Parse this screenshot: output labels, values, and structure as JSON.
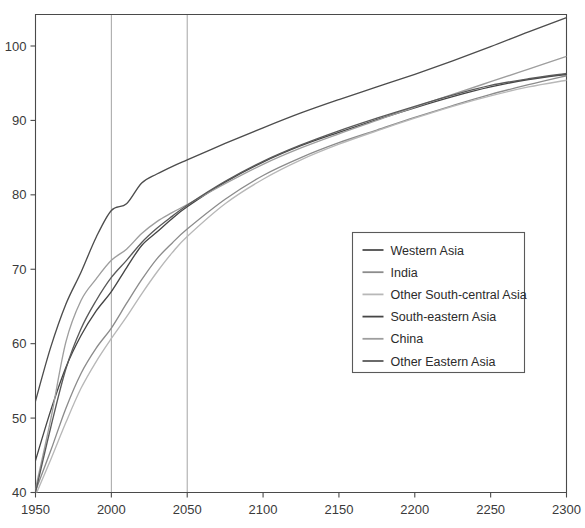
{
  "chart_data": {
    "type": "line",
    "title": "",
    "xlabel": "",
    "ylabel": "",
    "xlim": [
      1950,
      2300
    ],
    "ylim": [
      40,
      105
    ],
    "xticks": [
      1950,
      2000,
      2050,
      2100,
      2150,
      2200,
      2250,
      2300
    ],
    "yticks": [
      40,
      50,
      60,
      70,
      80,
      90,
      100
    ],
    "grid": "vertical gridlines at 2000 and 2050 only",
    "gridlines_x": [
      2000,
      2050
    ],
    "legend_position": "center-right inside axes",
    "x": [
      1950,
      1960,
      1970,
      1980,
      1990,
      2000,
      2010,
      2020,
      2030,
      2040,
      2050,
      2075,
      2100,
      2125,
      2150,
      2175,
      2200,
      2225,
      2250,
      2275,
      2300
    ],
    "series": [
      {
        "name": "Western Asia",
        "color": "#4d4d4d",
        "values": [
          52.3,
          59.5,
          65.3,
          69.6,
          74.3,
          77.9,
          78.8,
          81.6,
          82.8,
          83.8,
          84.7,
          86.9,
          89.0,
          91.0,
          92.8,
          94.5,
          96.2,
          98.0,
          99.9,
          101.9,
          103.8
        ]
      },
      {
        "name": "India",
        "color": "#8c8c8c",
        "values": [
          40.2,
          45.6,
          51.3,
          56.0,
          59.4,
          62.1,
          65.4,
          68.6,
          71.4,
          73.5,
          75.4,
          79.4,
          82.6,
          85.0,
          87.0,
          88.7,
          90.4,
          92.0,
          93.5,
          94.8,
          96.0
        ]
      },
      {
        "name": "Other South-central Asia",
        "color": "#b8b8b8",
        "values": [
          39.6,
          44.4,
          49.4,
          54.0,
          57.6,
          60.7,
          63.6,
          66.7,
          69.6,
          72.2,
          74.4,
          78.8,
          82.1,
          84.7,
          86.8,
          88.6,
          90.3,
          91.9,
          93.3,
          94.5,
          95.4
        ]
      },
      {
        "name": "South-eastern Asia",
        "color": "#464646",
        "values": [
          44.3,
          51.0,
          56.8,
          61.1,
          64.4,
          67.0,
          70.2,
          73.2,
          75.0,
          76.8,
          78.4,
          81.7,
          84.4,
          86.6,
          88.4,
          90.1,
          91.7,
          93.2,
          94.5,
          95.5,
          96.2
        ]
      },
      {
        "name": "China",
        "color": "#9e9e9e",
        "values": [
          40.5,
          49.8,
          60.2,
          65.8,
          68.7,
          71.2,
          72.7,
          74.8,
          76.4,
          77.6,
          78.7,
          81.5,
          84.1,
          86.3,
          88.2,
          90.0,
          91.8,
          93.5,
          95.2,
          96.9,
          98.6
        ]
      },
      {
        "name": "Other Eastern Asia",
        "color": "#5a5a5a",
        "values": [
          40.0,
          48.7,
          56.6,
          62.0,
          65.8,
          68.9,
          71.2,
          73.6,
          75.5,
          77.1,
          78.6,
          81.8,
          84.5,
          86.7,
          88.6,
          90.3,
          91.9,
          93.4,
          94.7,
          95.6,
          96.3
        ]
      }
    ],
    "legend_entries": [
      "Western Asia",
      "India",
      "Other South-central Asia",
      "South-eastern Asia",
      "China",
      "Other Eastern Asia"
    ]
  },
  "axes": {
    "x_tick_labels": [
      "1950",
      "2000",
      "2050",
      "2100",
      "2150",
      "2200",
      "2250",
      "2300"
    ],
    "y_tick_labels": [
      "40",
      "50",
      "60",
      "70",
      "80",
      "90",
      "100"
    ]
  },
  "colors": {
    "axis": "#4a4a4a",
    "grid": "#9a9a9a",
    "background": "#ffffff",
    "text": "#2b2b2b"
  }
}
